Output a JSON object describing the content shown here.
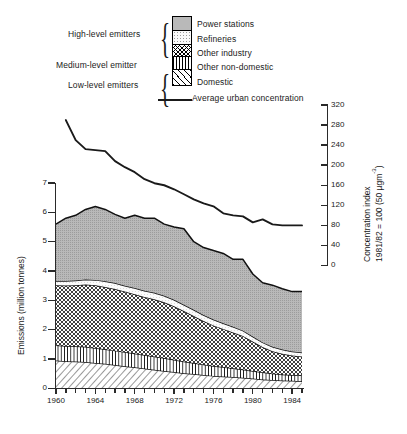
{
  "chart_data": {
    "type": "area",
    "title": "",
    "xlabel": "",
    "ylabel": "Emissions (million tonnes)",
    "y2label_line1": "Concentration index",
    "y2label_line2": "1981/82 = 100 (50 µgm",
    "y2label_sup": "-3",
    "y2label_close": ")",
    "grid": false,
    "legend_position": "top",
    "xlim": [
      1960,
      1985
    ],
    "ylim": [
      0,
      7
    ],
    "y2lim": [
      0,
      320
    ],
    "yticks": [
      0,
      1,
      2,
      3,
      4,
      5,
      6,
      7
    ],
    "y2ticks": [
      0,
      40,
      80,
      120,
      160,
      200,
      240,
      280,
      320
    ],
    "xticklabels": [
      "1960",
      "1964",
      "1968",
      "1972",
      "1976",
      "1980",
      "1984"
    ],
    "xtickvalues": [
      1960,
      1964,
      1968,
      1972,
      1976,
      1980,
      1984
    ],
    "x": [
      1960,
      1961,
      1962,
      1963,
      1964,
      1965,
      1966,
      1967,
      1968,
      1969,
      1970,
      1971,
      1972,
      1973,
      1974,
      1975,
      1976,
      1977,
      1978,
      1979,
      1980,
      1981,
      1982,
      1983,
      1984,
      1985
    ],
    "series": [
      {
        "name": "Domestic",
        "pattern": "diagonal-hatch",
        "values": [
          0.95,
          0.93,
          0.92,
          0.9,
          0.87,
          0.84,
          0.8,
          0.76,
          0.72,
          0.68,
          0.64,
          0.6,
          0.56,
          0.52,
          0.49,
          0.46,
          0.43,
          0.41,
          0.39,
          0.37,
          0.34,
          0.31,
          0.29,
          0.27,
          0.26,
          0.25
        ]
      },
      {
        "name": "Other non-domestic",
        "pattern": "vertical-lines",
        "values": [
          0.52,
          0.52,
          0.52,
          0.52,
          0.51,
          0.5,
          0.49,
          0.48,
          0.47,
          0.46,
          0.45,
          0.44,
          0.42,
          0.4,
          0.38,
          0.36,
          0.34,
          0.32,
          0.3,
          0.28,
          0.26,
          0.24,
          0.22,
          0.21,
          0.2,
          0.2
        ]
      },
      {
        "name": "Other industry",
        "pattern": "cross-hatch",
        "values": [
          2.05,
          2.06,
          2.08,
          2.12,
          2.14,
          2.12,
          2.1,
          2.06,
          2.02,
          1.98,
          1.95,
          1.9,
          1.82,
          1.72,
          1.6,
          1.48,
          1.38,
          1.3,
          1.22,
          1.14,
          1.0,
          0.86,
          0.76,
          0.7,
          0.66,
          0.64
        ]
      },
      {
        "name": "Refineries",
        "pattern": "fine-dots",
        "values": [
          0.14,
          0.15,
          0.16,
          0.17,
          0.18,
          0.19,
          0.2,
          0.2,
          0.21,
          0.21,
          0.22,
          0.22,
          0.22,
          0.21,
          0.21,
          0.2,
          0.2,
          0.19,
          0.19,
          0.18,
          0.17,
          0.16,
          0.15,
          0.15,
          0.14,
          0.14
        ]
      },
      {
        "name": "Power stations",
        "pattern": "gray-stipple",
        "values": [
          1.94,
          2.14,
          2.22,
          2.39,
          2.5,
          2.45,
          2.34,
          2.3,
          2.48,
          2.47,
          2.54,
          2.44,
          2.48,
          2.59,
          2.32,
          2.3,
          2.35,
          2.38,
          2.3,
          2.43,
          2.13,
          2.03,
          2.1,
          2.07,
          2.04,
          2.07
        ]
      }
    ],
    "totals": [
      5.6,
      5.8,
      5.9,
      6.1,
      6.2,
      6.1,
      5.93,
      5.8,
      5.9,
      5.8,
      5.8,
      5.6,
      5.5,
      5.44,
      5.0,
      4.8,
      4.7,
      4.6,
      4.4,
      4.4,
      3.9,
      3.6,
      3.52,
      3.4,
      3.3,
      3.3
    ],
    "line_series": {
      "name": "Average urban concentration",
      "axis": "right",
      "x": [
        1961,
        1962,
        1963,
        1964,
        1965,
        1966,
        1967,
        1968,
        1969,
        1970,
        1971,
        1972,
        1973,
        1974,
        1975,
        1976,
        1977,
        1978,
        1979,
        1980,
        1981,
        1982,
        1983,
        1984,
        1985
      ],
      "values": [
        290,
        250,
        232,
        230,
        228,
        208,
        196,
        186,
        172,
        164,
        160,
        152,
        142,
        132,
        124,
        118,
        104,
        100,
        98,
        86,
        92,
        82,
        80,
        80,
        80
      ]
    }
  },
  "legend": {
    "brackets": [
      {
        "label": "High-level emitters"
      },
      {
        "label": "Medium-level emitter"
      },
      {
        "label": "Low-level emitters"
      }
    ],
    "entries": [
      {
        "label": "Power stations",
        "pattern": "gray-stipple"
      },
      {
        "label": "Refineries",
        "pattern": "fine-dots"
      },
      {
        "label": "Other industry",
        "pattern": "cross-hatch"
      },
      {
        "label": "Other non-domestic",
        "pattern": "vertical-lines"
      },
      {
        "label": "Domestic",
        "pattern": "diagonal-hatch"
      }
    ],
    "line_label": "Average urban concentration"
  },
  "colors": {
    "ink": "#1a1a1a",
    "power_stations_fill": "#b9b9b9",
    "refineries_fill": "#fbfbfb",
    "background": "#ffffff"
  }
}
